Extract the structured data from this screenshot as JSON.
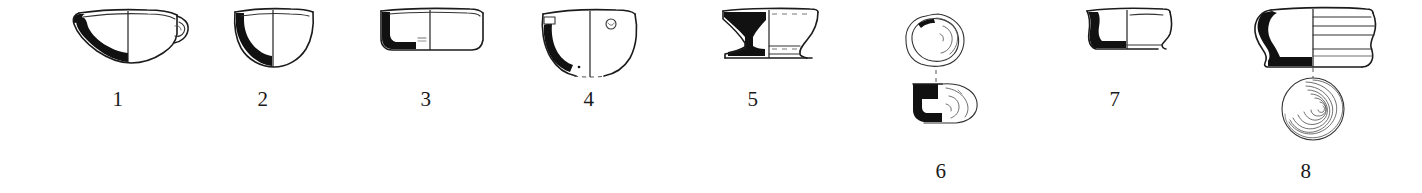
{
  "plate": {
    "kind": "archaeological-pottery-profile-plate",
    "background_color": "#ffffff",
    "ink_color": "#111111",
    "figure_count": 8,
    "labels": [
      "1",
      "2",
      "3",
      "4",
      "5",
      "6",
      "7",
      "8"
    ]
  },
  "figures": [
    {
      "number": "1",
      "label": "1",
      "name": "shallow-bowl-with-lug",
      "views": [
        "profile-section"
      ],
      "label_x": 118,
      "label_y": 90
    },
    {
      "number": "2",
      "label": "2",
      "name": "deep-hemispherical-bowl",
      "views": [
        "profile-section"
      ],
      "label_x": 263,
      "label_y": 90
    },
    {
      "number": "3",
      "label": "3",
      "name": "wide-shallow-dish",
      "views": [
        "profile-section"
      ],
      "label_x": 426,
      "label_y": 90
    },
    {
      "number": "4",
      "label": "4",
      "name": "deep-bowl-with-perforation",
      "views": [
        "profile-section"
      ],
      "label_x": 589,
      "label_y": 90
    },
    {
      "number": "5",
      "label": "5",
      "name": "carinated-footed-bowl",
      "views": [
        "profile-section"
      ],
      "label_x": 753,
      "label_y": 90
    },
    {
      "number": "6",
      "label": "6",
      "name": "sherd-plan-and-profile",
      "views": [
        "plan",
        "profile-section"
      ],
      "label_x": 941,
      "label_y": 162
    },
    {
      "number": "7",
      "label": "7",
      "name": "small-rounded-bowl",
      "views": [
        "profile-section"
      ],
      "label_x": 1115,
      "label_y": 90
    },
    {
      "number": "8",
      "label": "8",
      "name": "thick-walled-jar-with-base-rings",
      "views": [
        "profile-section",
        "base-view-concentric-rings"
      ],
      "label_x": 1306,
      "label_y": 162
    }
  ]
}
